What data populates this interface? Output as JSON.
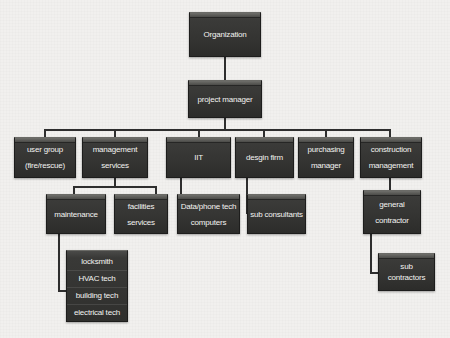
{
  "chart_title": "Organization Chart",
  "theme": {
    "background": "#f1f0ee",
    "box_fill": "#343432",
    "box_border": "#1d1d1c",
    "box_top_highlight": "#6b6b67",
    "text_color": "#f3f3f1",
    "connector_color": "#2e2e2e"
  },
  "nodes": {
    "organization": {
      "label": "Organization"
    },
    "project_manager": {
      "label": "project manager"
    },
    "user_group": {
      "line1": "user group",
      "line2": "(fire/rescue)"
    },
    "management_services": {
      "line1": "management",
      "line2": "services"
    },
    "iit": {
      "label": "IIT"
    },
    "design_firm": {
      "label": "desgin firm"
    },
    "purchasing_manager": {
      "line1": "purchasing",
      "line2": "manager"
    },
    "construction_management": {
      "line1": "construction",
      "line2": "management"
    },
    "maintenance": {
      "label": "maintenance"
    },
    "facilities_services": {
      "line1": "facilities",
      "line2": "services"
    },
    "data_phone_tech": {
      "line1": "Data/phone tech",
      "line2": "computers"
    },
    "sub_consultants": {
      "label": "sub consultants"
    },
    "general_contractor": {
      "line1": "general",
      "line2": "contractor"
    },
    "sub_contractors": {
      "label": "sub contractors"
    },
    "trades": {
      "rows": [
        {
          "label": "locksmith"
        },
        {
          "label": "HVAC tech"
        },
        {
          "label": "building tech"
        },
        {
          "label": "electrical tech"
        }
      ]
    }
  },
  "hierarchy": {
    "root": "Organization",
    "edges": [
      {
        "from": "Organization",
        "to": "project manager"
      },
      {
        "from": "project manager",
        "to": "user group (fire/rescue)"
      },
      {
        "from": "project manager",
        "to": "management services"
      },
      {
        "from": "project manager",
        "to": "IIT"
      },
      {
        "from": "project manager",
        "to": "desgin firm"
      },
      {
        "from": "project manager",
        "to": "purchasing manager"
      },
      {
        "from": "project manager",
        "to": "construction management"
      },
      {
        "from": "management services",
        "to": "maintenance"
      },
      {
        "from": "management services",
        "to": "facilities services"
      },
      {
        "from": "IIT",
        "to": "Data/phone tech computers"
      },
      {
        "from": "desgin firm",
        "to": "sub consultants"
      },
      {
        "from": "construction management",
        "to": "general contractor"
      },
      {
        "from": "general contractor",
        "to": "sub contractors"
      },
      {
        "from": "maintenance",
        "to": "locksmith"
      },
      {
        "from": "maintenance",
        "to": "HVAC tech"
      },
      {
        "from": "maintenance",
        "to": "building tech"
      },
      {
        "from": "maintenance",
        "to": "electrical tech"
      }
    ]
  }
}
